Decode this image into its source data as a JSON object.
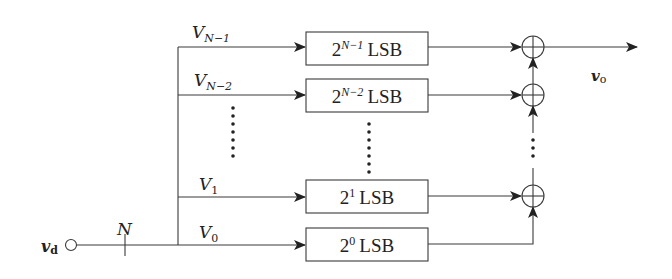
{
  "diagram": {
    "type": "weighted-sum DAC block diagram",
    "input": {
      "label": "v",
      "sub": "d",
      "bus_width_label": "N"
    },
    "output": {
      "label": "v",
      "sub": "o"
    },
    "branches": [
      {
        "name": "V",
        "sub": "N−1",
        "box_base": "2",
        "box_exp": "N−1",
        "box_unit": "LSB"
      },
      {
        "name": "V",
        "sub": "N−2",
        "box_base": "2",
        "box_exp": "N−2",
        "box_unit": "LSB"
      },
      {
        "name": "V",
        "sub": "1",
        "box_base": "2",
        "box_exp": "1",
        "box_unit": "LSB"
      },
      {
        "name": "V",
        "sub": "0",
        "box_base": "2",
        "box_exp": "0",
        "box_unit": "LSB"
      }
    ],
    "ellipsis": "⋮",
    "adders": [
      "⊕",
      "⊕",
      "⊕"
    ],
    "colors": {
      "line": "#3a3a3a",
      "text": "#222222",
      "background": "#ffffff"
    }
  }
}
